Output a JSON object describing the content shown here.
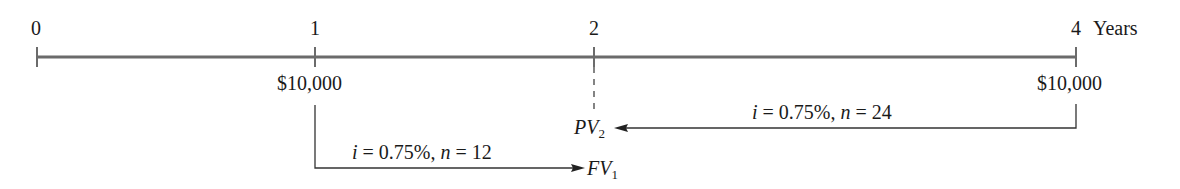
{
  "diagram": {
    "type": "timeline",
    "unit_label": "Years",
    "ticks": [
      {
        "label": "0",
        "x": 37
      },
      {
        "label": "1",
        "x": 315
      },
      {
        "label": "2",
        "x": 594
      },
      {
        "label": "4",
        "x": 1076
      }
    ],
    "cash_flows": [
      {
        "period": "1",
        "amount": "$10,000"
      },
      {
        "period": "4",
        "amount": "$10,000"
      }
    ],
    "arrows": [
      {
        "from": "1",
        "to_label": "FV",
        "to_sub": "1",
        "rate_text": "i",
        "rest_text": " = 0.75%, ",
        "n_text": "n",
        "n_value": " = 12"
      },
      {
        "from": "4",
        "to_label": "PV",
        "to_sub": "2",
        "rate_text": "i",
        "rest_text": " = 0.75%, ",
        "n_text": "n",
        "n_value": " = 24"
      }
    ]
  }
}
